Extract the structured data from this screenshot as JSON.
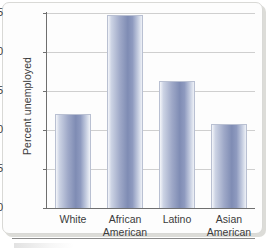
{
  "chart_data": {
    "type": "bar",
    "title": "",
    "xlabel": "",
    "ylabel": "Percent unemployed",
    "categories": [
      "White",
      "African American",
      "Latino",
      "Asian American"
    ],
    "category_lines": [
      [
        "White",
        ""
      ],
      [
        "African",
        "American"
      ],
      [
        "Latino",
        ""
      ],
      [
        "Asian",
        "American"
      ]
    ],
    "values": [
      12.1,
      24.7,
      16.3,
      10.8
    ],
    "ylim": [
      0,
      25
    ],
    "yticks": [
      0,
      5,
      10,
      15,
      20,
      25
    ],
    "ytick_labels": [
      "0",
      "5",
      "10",
      "15",
      "20",
      "25"
    ],
    "grid": true,
    "grid_axis": "y",
    "legend": false,
    "bar_color": "#8e9abf",
    "bar_edge_color": "#b9c0d2",
    "gridline_color": "#cfcfcf",
    "axis_color": "#6f6f6f",
    "text_color": "#3b3b3b",
    "background": "#fdfdfd"
  }
}
